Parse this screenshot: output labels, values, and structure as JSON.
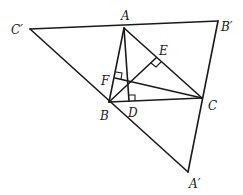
{
  "diagram": {
    "colors": {
      "stroke": "#1a1a1a",
      "background": "#ffffff"
    },
    "points": {
      "A": {
        "label": "A",
        "x": 124,
        "y": 28
      },
      "B": {
        "label": "B",
        "x": 109,
        "y": 102
      },
      "C": {
        "label": "C",
        "x": 202,
        "y": 98
      },
      "A_prime": {
        "label": "A′",
        "x": 188,
        "y": 172
      },
      "B_prime": {
        "label": "B′",
        "x": 218,
        "y": 21
      },
      "C_prime": {
        "label": "C′",
        "x": 30,
        "y": 29
      },
      "D": {
        "label": "D",
        "x": 129,
        "y": 101
      },
      "E": {
        "label": "E",
        "x": 156,
        "y": 58
      },
      "F": {
        "label": "F",
        "x": 115,
        "y": 78
      },
      "H": {
        "label": "",
        "x": 127,
        "y": 83
      }
    },
    "segments": [
      [
        "C_prime",
        "B_prime"
      ],
      [
        "B_prime",
        "A_prime"
      ],
      [
        "A_prime",
        "C_prime"
      ],
      [
        "A",
        "B"
      ],
      [
        "B",
        "C"
      ],
      [
        "A",
        "C"
      ],
      [
        "A",
        "D"
      ],
      [
        "B",
        "E"
      ],
      [
        "C",
        "F"
      ]
    ],
    "right_angle_marks": [
      "D",
      "E",
      "F"
    ]
  }
}
